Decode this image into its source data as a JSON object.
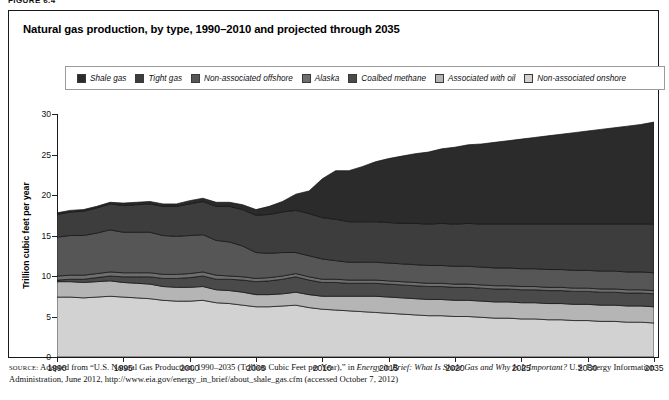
{
  "running_head": "FIGURE 6.4",
  "title": "Natural gas production, by type, 1990–2010 and projected through 2035",
  "legend": {
    "items": [
      {
        "label": "Shale gas",
        "color": "#2b2b2b"
      },
      {
        "label": "Tight gas",
        "color": "#3d3d3d"
      },
      {
        "label": "Non-associated offshore",
        "color": "#565656"
      },
      {
        "label": "Alaska",
        "color": "#6e6e6e"
      },
      {
        "label": "Coalbed methane",
        "color": "#4a4a4a"
      },
      {
        "label": "Associated with oil",
        "color": "#b5b5b5"
      },
      {
        "label": "Non-associated onshore",
        "color": "#d2d2d2"
      }
    ]
  },
  "source": {
    "label": "SOURCE:",
    "line1_a": " Adapted from “U.S. Natural Gas Production, 1990–2035 (Trillion Cubic Feet per Year),” in ",
    "line1_italic": "Energy in Brief: What Is Shale Gas and Why Is It Important?",
    "line2_b": " U.S. Energy Information Administration, June 2012, http://www.eia.gov/energy_in_brief/about_shale_gas.cfm (accessed October 7, 2012)"
  },
  "chart_data": {
    "type": "area",
    "title": "Natural gas production, by type, 1990–2010 and projected through 2035",
    "xlabel": "",
    "ylabel": "Trillion cubic feet per year",
    "xlim": [
      1990,
      2035
    ],
    "ylim": [
      0,
      30
    ],
    "ytick_values": [
      0,
      5,
      10,
      15,
      20,
      25,
      30
    ],
    "xtick_values": [
      1990,
      1995,
      2000,
      2005,
      2010,
      2015,
      2020,
      2025,
      2030,
      2035
    ],
    "grid": false,
    "legend_position": "top",
    "stacked": true,
    "stack_order_bottom_to_top": [
      "Non-associated onshore",
      "Associated with oil",
      "Coalbed methane",
      "Alaska",
      "Non-associated offshore",
      "Tight gas",
      "Shale gas"
    ],
    "x": [
      1990,
      1991,
      1992,
      1993,
      1994,
      1995,
      1996,
      1997,
      1998,
      1999,
      2000,
      2001,
      2002,
      2003,
      2004,
      2005,
      2006,
      2007,
      2008,
      2009,
      2010,
      2011,
      2012,
      2013,
      2014,
      2015,
      2016,
      2017,
      2018,
      2019,
      2020,
      2021,
      2022,
      2023,
      2024,
      2025,
      2026,
      2027,
      2028,
      2029,
      2030,
      2031,
      2032,
      2033,
      2034,
      2035
    ],
    "series": [
      {
        "name": "Non-associated onshore",
        "color": "#d2d2d2",
        "values": [
          7.4,
          7.4,
          7.3,
          7.4,
          7.5,
          7.4,
          7.3,
          7.2,
          7.0,
          6.9,
          6.9,
          7.0,
          6.7,
          6.6,
          6.4,
          6.2,
          6.2,
          6.3,
          6.4,
          6.1,
          5.9,
          5.8,
          5.7,
          5.6,
          5.5,
          5.4,
          5.3,
          5.2,
          5.1,
          5.1,
          5.0,
          5.0,
          4.9,
          4.8,
          4.8,
          4.7,
          4.7,
          4.6,
          4.6,
          4.5,
          4.5,
          4.4,
          4.4,
          4.3,
          4.3,
          4.2
        ]
      },
      {
        "name": "Associated with oil",
        "color": "#b5b5b5",
        "values": [
          1.9,
          1.9,
          1.9,
          1.9,
          1.9,
          1.8,
          1.8,
          1.8,
          1.7,
          1.7,
          1.7,
          1.7,
          1.6,
          1.6,
          1.6,
          1.5,
          1.5,
          1.5,
          1.6,
          1.6,
          1.6,
          1.7,
          1.8,
          1.9,
          2.0,
          2.0,
          2.0,
          2.0,
          2.0,
          2.0,
          2.0,
          2.0,
          2.0,
          2.0,
          2.0,
          2.0,
          2.0,
          2.0,
          2.0,
          2.0,
          2.0,
          2.0,
          2.0,
          2.0,
          2.0,
          2.0
        ]
      },
      {
        "name": "Coalbed methane",
        "color": "#4a4a4a",
        "values": [
          0.2,
          0.3,
          0.4,
          0.5,
          0.6,
          0.7,
          0.8,
          0.9,
          1.0,
          1.1,
          1.2,
          1.3,
          1.3,
          1.4,
          1.5,
          1.6,
          1.7,
          1.8,
          1.9,
          1.8,
          1.7,
          1.7,
          1.6,
          1.6,
          1.6,
          1.6,
          1.6,
          1.6,
          1.6,
          1.6,
          1.6,
          1.6,
          1.6,
          1.6,
          1.6,
          1.6,
          1.6,
          1.6,
          1.6,
          1.6,
          1.6,
          1.6,
          1.6,
          1.6,
          1.6,
          1.6
        ]
      },
      {
        "name": "Alaska",
        "color": "#6e6e6e",
        "values": [
          0.5,
          0.5,
          0.5,
          0.5,
          0.5,
          0.5,
          0.5,
          0.5,
          0.5,
          0.5,
          0.5,
          0.5,
          0.5,
          0.4,
          0.4,
          0.4,
          0.4,
          0.4,
          0.4,
          0.4,
          0.4,
          0.4,
          0.4,
          0.4,
          0.4,
          0.4,
          0.4,
          0.4,
          0.4,
          0.4,
          0.4,
          0.4,
          0.4,
          0.4,
          0.4,
          0.4,
          0.4,
          0.4,
          0.4,
          0.4,
          0.4,
          0.4,
          0.4,
          0.4,
          0.4,
          0.4
        ]
      },
      {
        "name": "Non-associated offshore",
        "color": "#565656",
        "values": [
          4.8,
          4.9,
          4.9,
          5.0,
          5.2,
          5.0,
          5.0,
          5.0,
          4.8,
          4.7,
          4.7,
          4.6,
          4.3,
          4.2,
          3.8,
          3.2,
          3.0,
          2.9,
          2.6,
          2.6,
          2.5,
          2.3,
          2.2,
          2.2,
          2.2,
          2.2,
          2.2,
          2.2,
          2.2,
          2.2,
          2.2,
          2.2,
          2.2,
          2.2,
          2.2,
          2.2,
          2.2,
          2.2,
          2.2,
          2.2,
          2.2,
          2.2,
          2.2,
          2.2,
          2.2,
          2.2
        ]
      },
      {
        "name": "Tight gas",
        "color": "#3d3d3d",
        "values": [
          2.8,
          2.9,
          3.0,
          3.1,
          3.2,
          3.3,
          3.4,
          3.5,
          3.6,
          3.7,
          3.9,
          4.1,
          4.2,
          4.4,
          4.5,
          4.6,
          4.8,
          5.0,
          5.2,
          5.2,
          5.1,
          5.1,
          5.0,
          5.0,
          5.0,
          5.0,
          5.0,
          5.1,
          5.1,
          5.2,
          5.2,
          5.3,
          5.3,
          5.4,
          5.4,
          5.5,
          5.5,
          5.6,
          5.6,
          5.7,
          5.7,
          5.8,
          5.8,
          5.9,
          5.9,
          6.0
        ]
      },
      {
        "name": "Shale gas",
        "color": "#2b2b2b",
        "values": [
          0.2,
          0.2,
          0.2,
          0.2,
          0.2,
          0.3,
          0.3,
          0.3,
          0.3,
          0.3,
          0.4,
          0.4,
          0.5,
          0.5,
          0.6,
          0.7,
          1.0,
          1.3,
          2.0,
          2.8,
          4.8,
          6.0,
          6.3,
          6.8,
          7.4,
          7.9,
          8.3,
          8.6,
          8.9,
          9.2,
          9.5,
          9.7,
          9.9,
          10.1,
          10.3,
          10.5,
          10.7,
          10.9,
          11.1,
          11.3,
          11.5,
          11.7,
          11.9,
          12.1,
          12.3,
          12.6
        ]
      }
    ],
    "totals_key_points": {
      "1990": 17.8,
      "1994": 19.1,
      "2001": 19.6,
      "2005": 18.2,
      "2010": 22.0,
      "2012": 23.5,
      "2013": 22.6,
      "2020": 25.9,
      "2025": 26.9,
      "2030": 27.7,
      "2035": 29.0
    }
  }
}
